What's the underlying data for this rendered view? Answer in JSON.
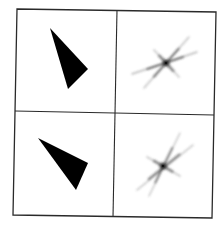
{
  "figure": {
    "description": "2x2 grid: left column shows solid black triangles, right column shows their star-shaped Fourier transform patterns",
    "frame_color": "#2a2a2a",
    "frame": {
      "top_left": [
        17,
        9
      ],
      "top_right": [
        216,
        12
      ],
      "bottom_right": [
        212,
        218
      ],
      "bottom_left": [
        13,
        215
      ]
    },
    "dividers": {
      "vertical": [
        [
          117,
          10
        ],
        [
          113,
          217
        ]
      ],
      "horizontal": [
        [
          15,
          111
        ],
        [
          214,
          115
        ]
      ]
    },
    "panels": [
      {
        "name": "triangle-top",
        "type": "triangle",
        "fill": "#000000",
        "points": [
          [
            50,
            28
          ],
          [
            88,
            69
          ],
          [
            68,
            89
          ]
        ]
      },
      {
        "name": "star-top",
        "type": "star",
        "center": [
          166,
          63
        ],
        "rays": [
          {
            "from": [
              144,
              88
            ],
            "to": [
              189,
              37
            ],
            "width": 2.2,
            "opacity": 0.55
          },
          {
            "from": [
              132,
              74
            ],
            "to": [
              197,
              52
            ],
            "width": 2.2,
            "opacity": 0.6
          },
          {
            "from": [
              154,
              50
            ],
            "to": [
              179,
              77
            ],
            "width": 3.0,
            "opacity": 0.45
          }
        ]
      },
      {
        "name": "triangle-bottom",
        "type": "triangle",
        "fill": "#000000",
        "points": [
          [
            38,
            138
          ],
          [
            88,
            163
          ],
          [
            76,
            190
          ]
        ]
      },
      {
        "name": "star-bottom",
        "type": "star",
        "center": [
          163,
          166
        ],
        "rays": [
          {
            "from": [
              149,
              196
            ],
            "to": [
              180,
              133
            ],
            "width": 2.0,
            "opacity": 0.55
          },
          {
            "from": [
              137,
              190
            ],
            "to": [
              193,
              145
            ],
            "width": 2.2,
            "opacity": 0.55
          },
          {
            "from": [
              147,
              157
            ],
            "to": [
              180,
              176
            ],
            "width": 3.0,
            "opacity": 0.45
          }
        ]
      }
    ]
  }
}
